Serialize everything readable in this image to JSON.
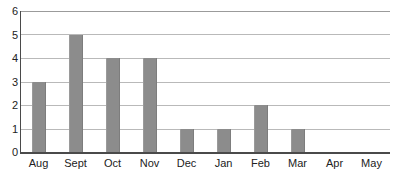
{
  "chart_data": {
    "type": "bar",
    "title": "",
    "subtitle": "",
    "xlabel": "",
    "ylabel": "",
    "categories": [
      "Aug",
      "Sept",
      "Oct",
      "Nov",
      "Dec",
      "Jan",
      "Feb",
      "Mar",
      "Apr",
      "May"
    ],
    "values": [
      3,
      5,
      4,
      4,
      1,
      1,
      2,
      1,
      0,
      0
    ],
    "ylim": [
      0,
      6
    ],
    "y_ticks": [
      0,
      1,
      2,
      3,
      4,
      5,
      6
    ],
    "y_tick_labels": [
      "0",
      "1",
      "2",
      "3",
      "4",
      "5",
      "6"
    ],
    "grid": true,
    "grid_axis": "y",
    "legend": false,
    "legend_position": "none",
    "annotations": [],
    "bar_color": "#8c8c8c",
    "gridline_color": "#b9b9b9",
    "axis_color": "#4a4a4a",
    "background_color": "#ffffff",
    "text_color": "#222222"
  },
  "axes": {
    "y_labels_desc": [
      "6",
      "5",
      "4",
      "3",
      "2",
      "1",
      "0"
    ],
    "x_labels": [
      "Aug",
      "Sept",
      "Oct",
      "Nov",
      "Dec",
      "Jan",
      "Feb",
      "Mar",
      "Apr",
      "May"
    ]
  }
}
